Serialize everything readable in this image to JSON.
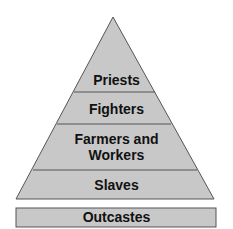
{
  "diagram": {
    "type": "social-pyramid",
    "colors": {
      "fill": "#c8c8c8",
      "stroke": "#555555",
      "text": "#111111"
    },
    "levels": [
      {
        "label": "Priests"
      },
      {
        "label": "Fighters"
      },
      {
        "label": "Farmers and Workers",
        "line1": "Farmers and",
        "line2": "Workers"
      },
      {
        "label": "Slaves"
      }
    ],
    "outside": {
      "label": "Outcastes"
    }
  }
}
